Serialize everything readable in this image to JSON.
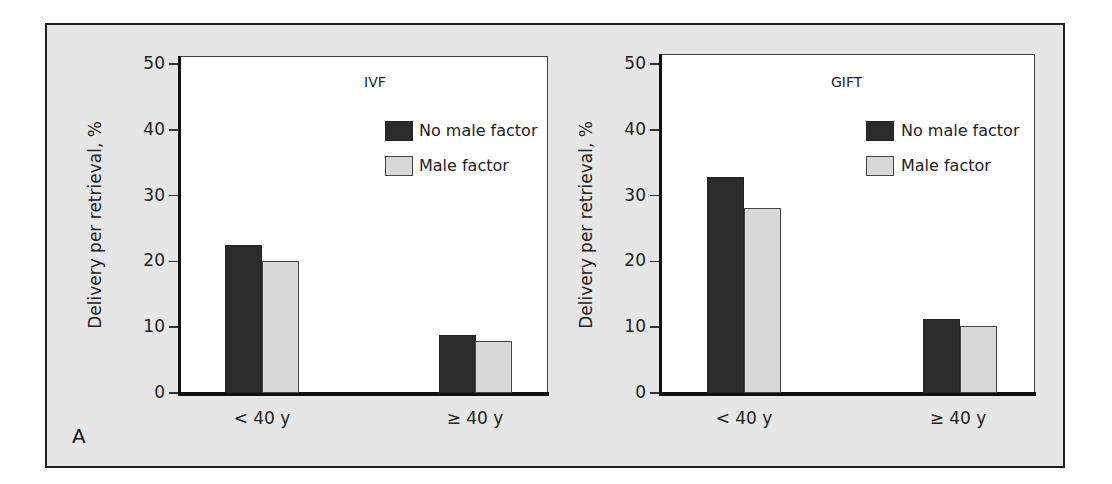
{
  "figure": {
    "panel_letter": "A",
    "y_axis_label": "Delivery per retrieval, %",
    "y_ticks": [
      "0",
      "10",
      "20",
      "30",
      "40",
      "50"
    ],
    "categories": [
      "< 40 y",
      "≥ 40 y"
    ],
    "legend": [
      {
        "label": "No male factor",
        "color": "#2b2b2b"
      },
      {
        "label": "Male factor",
        "color": "#d8d8d8"
      }
    ],
    "colors": {
      "background": "#e6e6e6",
      "plot": "#ffffff",
      "dark_bar": "#2b2b2b",
      "light_bar": "#d8d8d8"
    }
  },
  "panels": [
    {
      "title": "IVF"
    },
    {
      "title": "GIFT"
    }
  ],
  "chart_data": [
    {
      "type": "bar",
      "title": "IVF",
      "xlabel": "",
      "ylabel": "Delivery per retrieval, %",
      "ylim": [
        0,
        50
      ],
      "yticks": [
        0,
        10,
        20,
        30,
        40,
        50
      ],
      "grid": false,
      "legend_position": "upper right",
      "categories": [
        "< 40 y",
        "≥ 40 y"
      ],
      "series": [
        {
          "name": "No male factor",
          "values": [
            22.5,
            8.8
          ]
        },
        {
          "name": "Male factor",
          "values": [
            20.0,
            7.9
          ]
        }
      ]
    },
    {
      "type": "bar",
      "title": "GIFT",
      "xlabel": "",
      "ylabel": "Delivery per retrieval, %",
      "ylim": [
        0,
        50
      ],
      "yticks": [
        0,
        10,
        20,
        30,
        40,
        50
      ],
      "grid": false,
      "legend_position": "upper right",
      "categories": [
        "< 40 y",
        "≥ 40 y"
      ],
      "series": [
        {
          "name": "No male factor",
          "values": [
            32.8,
            11.2
          ]
        },
        {
          "name": "Male factor",
          "values": [
            28.1,
            10.2
          ]
        }
      ]
    }
  ]
}
